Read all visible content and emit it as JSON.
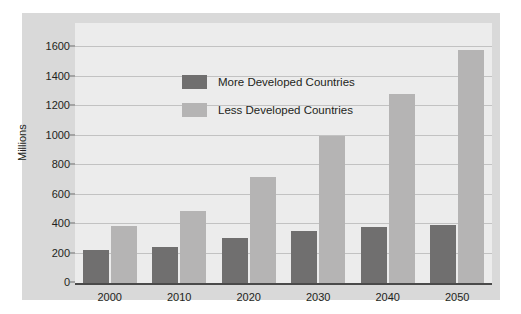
{
  "chart_data": {
    "type": "bar",
    "title": "",
    "xlabel": "",
    "ylabel": "Millions",
    "categories": [
      "2000",
      "2010",
      "2020",
      "2030",
      "2040",
      "2050"
    ],
    "series": [
      {
        "name": "More Developed Countries",
        "color": "#706f6f",
        "values": [
          225,
          245,
          305,
          355,
          380,
          395
        ]
      },
      {
        "name": "Less Developed Countries",
        "color": "#b5b4b4",
        "values": [
          388,
          485,
          720,
          1000,
          1280,
          1580
        ]
      }
    ],
    "ylim": [
      0,
      1600
    ],
    "yticks": [
      0,
      200,
      400,
      600,
      800,
      1000,
      1200,
      1400,
      1600
    ],
    "ytick_labels": [
      "0",
      "200",
      "400",
      "600",
      "800",
      "1000",
      "1200",
      "1400",
      "1600"
    ],
    "grid": true,
    "legend_position": "upper-left-inside"
  },
  "legend": {
    "items": [
      {
        "label": "More Developed Countries",
        "swatch": "more"
      },
      {
        "label": "Less Developed Countries",
        "swatch": "less"
      }
    ]
  },
  "colors": {
    "page_background": "#ffffff",
    "figure_background": "#d9d9d9",
    "plot_background": "#ececec",
    "gridline": "#c2c2c2",
    "axis": "#4a4a4a",
    "text": "#231f20",
    "series_more": "#706f6f",
    "series_less": "#b5b4b4"
  }
}
